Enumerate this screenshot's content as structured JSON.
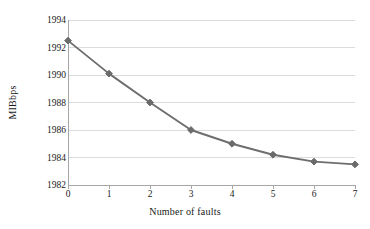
{
  "chart_data": {
    "type": "line",
    "title": "",
    "subtitle": "",
    "xlabel": "Number of faults",
    "ylabel": "MIBbps",
    "x": [
      0,
      1,
      2,
      3,
      4,
      5,
      6,
      7
    ],
    "values": [
      1992.5,
      1990.1,
      1988.0,
      1986.0,
      1985.0,
      1984.2,
      1983.7,
      1983.5
    ],
    "series": [
      {
        "name": "",
        "values": [
          1992.5,
          1990.1,
          1988.0,
          1986.0,
          1985.0,
          1984.2,
          1983.7,
          1983.5
        ]
      }
    ],
    "xlim": [
      0,
      7
    ],
    "ylim": [
      1982,
      1994
    ],
    "xticks": [
      "0",
      "1",
      "2",
      "3",
      "4",
      "5",
      "6",
      "7"
    ],
    "yticks": [
      "1982",
      "1984",
      "1986",
      "1988",
      "1990",
      "1992",
      "1994"
    ],
    "grid": "horizontal",
    "legend": "none",
    "marker": "diamond",
    "line_color": "#6e6e6e",
    "marker_color": "#6b6b6b",
    "grid_color": "#dcdcdc",
    "axis_color": "#a6a6a6",
    "text_color": "#1a1a1a",
    "background": "#ffffff"
  }
}
